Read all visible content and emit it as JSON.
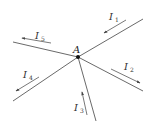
{
  "diagram": {
    "node": {
      "label": "A"
    },
    "currents": [
      {
        "id": "I1",
        "symbol": "I",
        "subscript": "1",
        "direction": "into-node"
      },
      {
        "id": "I2",
        "symbol": "I",
        "subscript": "2",
        "direction": "out-of-node"
      },
      {
        "id": "I3",
        "symbol": "I",
        "subscript": "3",
        "direction": "into-node"
      },
      {
        "id": "I4",
        "symbol": "I",
        "subscript": "4",
        "direction": "out-of-node"
      },
      {
        "id": "I5",
        "symbol": "I",
        "subscript": "5",
        "direction": "out-of-node"
      }
    ],
    "colors": {
      "wire": "#6a6a6a",
      "text": "#333333",
      "node": "#111111"
    }
  }
}
